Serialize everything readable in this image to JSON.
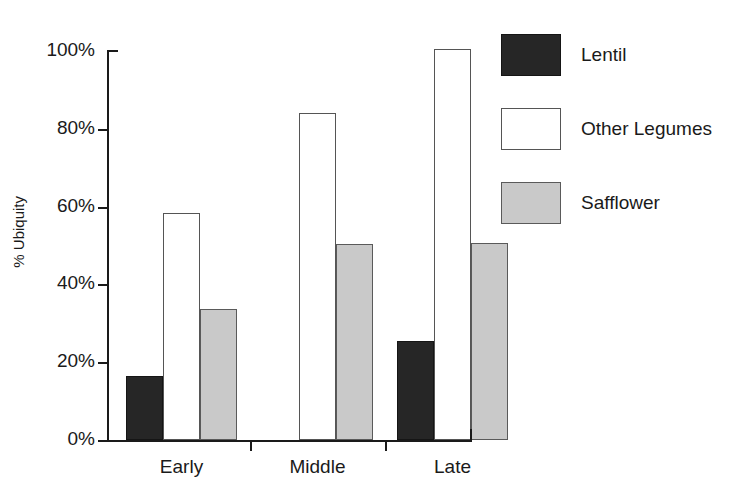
{
  "chart_data": {
    "type": "bar",
    "title": "",
    "xlabel": "",
    "ylabel": "% Ubiquity",
    "categories": [
      "Early",
      "Middle",
      "Late"
    ],
    "series": [
      {
        "name": "Lentil",
        "values": [
          16.5,
          0,
          25.5
        ],
        "color": "#262626",
        "fill": "fill-dark"
      },
      {
        "name": "Other Legumes",
        "values": [
          58.4,
          84.0,
          100.5
        ],
        "color": "#ffffff",
        "fill": "fill-white"
      },
      {
        "name": "Safflower",
        "values": [
          33.6,
          50.4,
          50.6
        ],
        "color": "#c9c9c9",
        "fill": "fill-gray"
      }
    ],
    "ylim": [
      0,
      100
    ],
    "ytick_labels": [
      "0%",
      "20%",
      "40%",
      "60%",
      "80%",
      "100%"
    ],
    "ytick_values": [
      0,
      20,
      40,
      60,
      80,
      100
    ],
    "grid": false,
    "legend_position": "right",
    "legend": [
      "Lentil",
      "Other Legumes",
      "Safflower"
    ]
  },
  "axis": {
    "yticks": [
      {
        "label": "100%",
        "value": 100
      },
      {
        "label": "80%",
        "value": 80
      },
      {
        "label": "60%",
        "value": 60
      },
      {
        "label": "40%",
        "value": 40
      },
      {
        "label": "20%",
        "value": 20
      },
      {
        "label": "0%",
        "value": 0
      }
    ],
    "ylabel": "% Ubiquity",
    "group_labels": [
      "Early",
      "Middle",
      "Late"
    ]
  },
  "legend": {
    "items": [
      {
        "label": "Lentil",
        "swatch": "dark-swatch"
      },
      {
        "label": "Other Legumes",
        "swatch": "white-swatch"
      },
      {
        "label": "Safflower",
        "swatch": "gray-swatch"
      }
    ]
  }
}
